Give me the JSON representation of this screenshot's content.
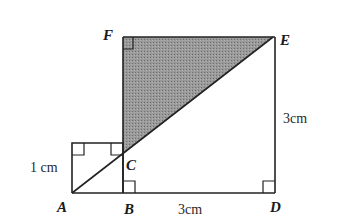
{
  "diagram": {
    "points": {
      "A": {
        "label": "A",
        "x": 72,
        "y": 193
      },
      "B": {
        "label": "B",
        "x": 123,
        "y": 193
      },
      "C": {
        "label": "C",
        "x": 123,
        "y": 154
      },
      "D": {
        "label": "D",
        "x": 275,
        "y": 193
      },
      "E": {
        "label": "E",
        "x": 273,
        "y": 37
      },
      "F": {
        "label": "F",
        "x": 123,
        "y": 37
      }
    },
    "measurements": {
      "small_square_side": "1 cm",
      "large_bottom": "3cm",
      "large_right": "3cm"
    },
    "shaded_region": "triangle F-C-E",
    "shade_color": "#8c8c8c"
  }
}
